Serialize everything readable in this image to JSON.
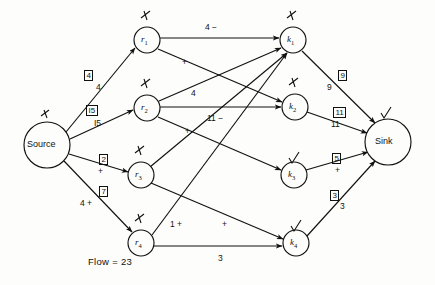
{
  "diagram": {
    "flow_label": "Flow = 23",
    "stroke_color": "#111111",
    "background_color": "#fdfdfb"
  },
  "nodes": [
    {
      "id": "source",
      "label": "Source",
      "kind": "terminal",
      "cx": 47,
      "cy": 145,
      "r": 23,
      "mark": "slash"
    },
    {
      "id": "r1",
      "label": "r",
      "sub": "1",
      "kind": "relay",
      "cx": 147,
      "cy": 40,
      "r": 13,
      "mark": "slash"
    },
    {
      "id": "r2",
      "label": "r",
      "sub": "2",
      "kind": "relay",
      "cx": 147,
      "cy": 108,
      "r": 13,
      "mark": "slash"
    },
    {
      "id": "r3",
      "label": "r",
      "sub": "3",
      "kind": "relay",
      "cx": 141,
      "cy": 175,
      "r": 13,
      "mark": "slash"
    },
    {
      "id": "r4",
      "label": "r",
      "sub": "4",
      "kind": "relay",
      "cx": 141,
      "cy": 243,
      "r": 13,
      "mark": "slash"
    },
    {
      "id": "k1",
      "label": "k",
      "sub": "1",
      "kind": "relay",
      "cx": 293,
      "cy": 40,
      "r": 13,
      "mark": "slash"
    },
    {
      "id": "k2",
      "label": "k",
      "sub": "2",
      "kind": "relay",
      "cx": 295,
      "cy": 107,
      "r": 13,
      "mark": "slash"
    },
    {
      "id": "k3",
      "label": "k",
      "sub": "3",
      "kind": "relay",
      "cx": 294,
      "cy": 175,
      "r": 13,
      "mark": "check"
    },
    {
      "id": "k4",
      "label": "k",
      "sub": "4",
      "kind": "relay",
      "cx": 296,
      "cy": 243,
      "r": 13,
      "mark": "check"
    },
    {
      "id": "sink",
      "label": "Sink",
      "kind": "terminal",
      "cx": 388,
      "cy": 142,
      "r": 23,
      "mark": "check"
    }
  ],
  "edges": [
    {
      "id": "source-r1",
      "from": "source",
      "to": "r1",
      "capacity": "4",
      "flow": "4"
    },
    {
      "id": "source-r2",
      "from": "source",
      "to": "r2",
      "capacity": "I5",
      "flow": "I5"
    },
    {
      "id": "source-r3",
      "from": "source",
      "to": "r3",
      "capacity": "2",
      "flow": "+"
    },
    {
      "id": "source-r4",
      "from": "source",
      "to": "r4",
      "capacity": "7",
      "flow": "4 +"
    },
    {
      "id": "r1-k1",
      "from": "r1",
      "to": "k1",
      "capacity": "",
      "flow": "4 −"
    },
    {
      "id": "r1-k2",
      "from": "r1",
      "to": "k2",
      "capacity": "",
      "flow": "+"
    },
    {
      "id": "r2-k1",
      "from": "r2",
      "to": "k1",
      "capacity": "",
      "flow": "4"
    },
    {
      "id": "r2-k2",
      "from": "r2",
      "to": "k2",
      "capacity": "",
      "flow": "11 −"
    },
    {
      "id": "r2-k3",
      "from": "r2",
      "to": "k3",
      "capacity": "",
      "flow": "+"
    },
    {
      "id": "r3-k1",
      "from": "r3",
      "to": "k1",
      "capacity": "",
      "flow": ""
    },
    {
      "id": "r4-k1",
      "from": "r4",
      "to": "k1",
      "capacity": "",
      "flow": "1 +"
    },
    {
      "id": "r4-k4",
      "from": "r4",
      "to": "k4",
      "capacity": "",
      "flow": "3"
    },
    {
      "id": "r3-k4",
      "from": "r3",
      "to": "k4",
      "capacity": "",
      "flow": "+"
    },
    {
      "id": "k1-sink",
      "from": "k1",
      "to": "sink",
      "capacity": "9",
      "flow": "9"
    },
    {
      "id": "k2-sink",
      "from": "k2",
      "to": "sink",
      "capacity": "11",
      "flow": "11"
    },
    {
      "id": "k3-sink",
      "from": "k3",
      "to": "sink",
      "capacity": "5",
      "flow": "+"
    },
    {
      "id": "k4-sink",
      "from": "k4",
      "to": "sink",
      "capacity": "3",
      "flow": "3"
    }
  ],
  "labels": {
    "boxed": [
      {
        "id": "box-source-r1",
        "text": "4",
        "x": 84,
        "y": 70
      },
      {
        "id": "box-source-r2",
        "text": "I5",
        "x": 86,
        "y": 105
      },
      {
        "id": "box-source-r3",
        "text": "2",
        "x": 99,
        "y": 154
      },
      {
        "id": "box-source-r4",
        "text": "7",
        "x": 99,
        "y": 186
      },
      {
        "id": "box-k1-sink",
        "text": "9",
        "x": 338,
        "y": 70
      },
      {
        "id": "box-k2-sink",
        "text": "11",
        "x": 333,
        "y": 107
      },
      {
        "id": "box-k3-sink",
        "text": "5",
        "x": 332,
        "y": 153
      },
      {
        "id": "box-k4-sink",
        "text": "3",
        "x": 330,
        "y": 190
      }
    ],
    "plain": [
      {
        "id": "lbl-source-r1",
        "text": "4",
        "x": 96,
        "y": 82
      },
      {
        "id": "lbl-source-r2",
        "text": "I5",
        "x": 94,
        "y": 118
      },
      {
        "id": "lbl-source-r3",
        "text": "+",
        "x": 98,
        "y": 166
      },
      {
        "id": "lbl-source-r4",
        "text": "4 +",
        "x": 80,
        "y": 198
      },
      {
        "id": "lbl-r1-k1",
        "text": "4 −",
        "x": 205,
        "y": 22
      },
      {
        "id": "lbl-r1-k2",
        "text": "+",
        "x": 182,
        "y": 57
      },
      {
        "id": "lbl-r2-k1",
        "text": "4",
        "x": 191,
        "y": 88
      },
      {
        "id": "lbl-r2-k2",
        "text": "11 −",
        "x": 207,
        "y": 113
      },
      {
        "id": "lbl-r2-k3",
        "text": "+",
        "x": 185,
        "y": 126
      },
      {
        "id": "lbl-r4-k1",
        "text": "1 +",
        "x": 170,
        "y": 219
      },
      {
        "id": "lbl-r3-k4",
        "text": "+",
        "x": 222,
        "y": 219
      },
      {
        "id": "lbl-r4-k4",
        "text": "3",
        "x": 218,
        "y": 253
      },
      {
        "id": "lbl-k1-sink",
        "text": "9",
        "x": 327,
        "y": 82
      },
      {
        "id": "lbl-k2-sink",
        "text": "11",
        "x": 331,
        "y": 119
      },
      {
        "id": "lbl-k3-sink",
        "text": "+",
        "x": 335,
        "y": 165
      },
      {
        "id": "lbl-k4-sink",
        "text": "3",
        "x": 340,
        "y": 201
      }
    ],
    "flow_text": {
      "text": "Flow = 23",
      "x": 88,
      "y": 256
    }
  }
}
